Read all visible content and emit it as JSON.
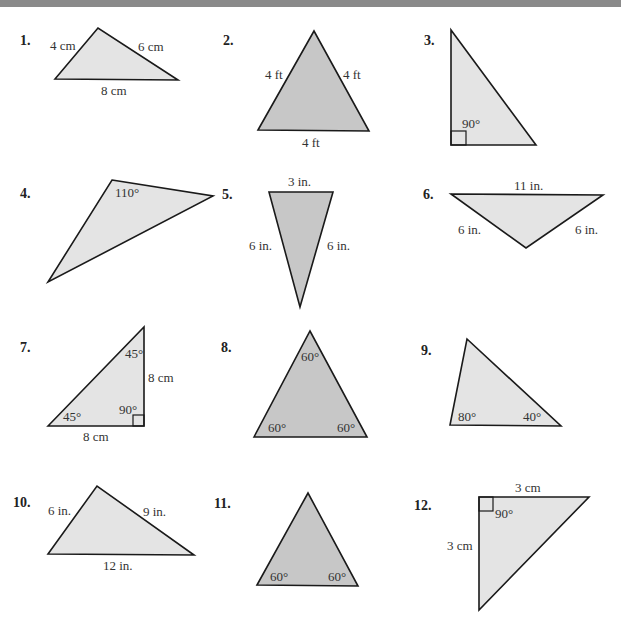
{
  "header": {
    "bar_color": "#8a8a8a"
  },
  "colors": {
    "light_fill": "#e4e4e4",
    "dark_fill": "#c7c7c7",
    "stroke": "#1a1a1a"
  },
  "problems": [
    {
      "number": "1.",
      "labels": [
        "4 cm",
        "6 cm",
        "8 cm"
      ]
    },
    {
      "number": "2.",
      "labels": [
        "4 ft",
        "4 ft",
        "4 ft"
      ]
    },
    {
      "number": "3.",
      "labels": [
        "90°"
      ]
    },
    {
      "number": "4.",
      "labels": [
        "110°"
      ]
    },
    {
      "number": "5.",
      "labels": [
        "3 in.",
        "6 in.",
        "6 in."
      ]
    },
    {
      "number": "6.",
      "labels": [
        "11 in.",
        "6 in.",
        "6 in."
      ]
    },
    {
      "number": "7.",
      "labels": [
        "45°",
        "8 cm",
        "45°",
        "90°",
        "8 cm"
      ]
    },
    {
      "number": "8.",
      "labels": [
        "60°",
        "60°",
        "60°"
      ]
    },
    {
      "number": "9.",
      "labels": [
        "80°",
        "40°"
      ]
    },
    {
      "number": "10.",
      "labels": [
        "6 in.",
        "9 in.",
        "12 in."
      ]
    },
    {
      "number": "11.",
      "labels": [
        "60°",
        "60°"
      ]
    },
    {
      "number": "12.",
      "labels": [
        "3 cm",
        "90°",
        "3 cm"
      ]
    }
  ]
}
